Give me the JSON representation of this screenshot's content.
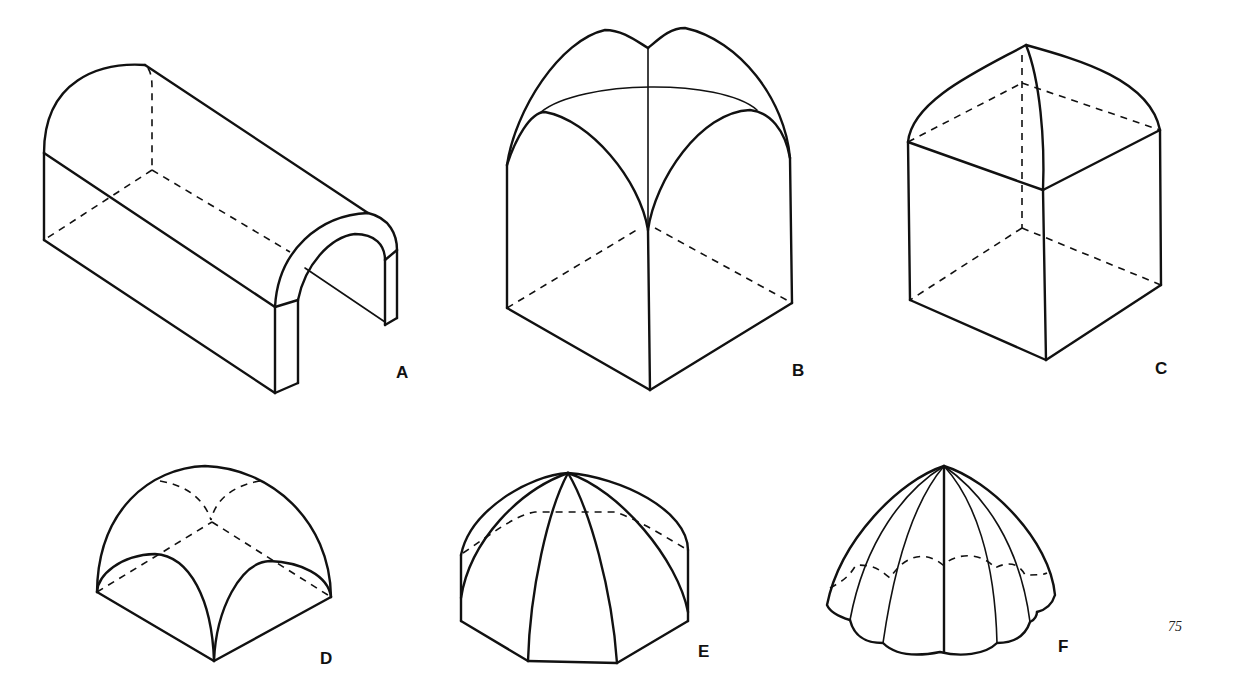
{
  "figure": {
    "panels": [
      {
        "id": "A",
        "label": "A",
        "subject": "barrel-vault"
      },
      {
        "id": "B",
        "label": "B",
        "subject": "groin-vault-pointed"
      },
      {
        "id": "C",
        "label": "C",
        "subject": "cloister-vault-on-cube"
      },
      {
        "id": "D",
        "label": "D",
        "subject": "domical-groin-vault"
      },
      {
        "id": "E",
        "label": "E",
        "subject": "octagonal-ribbed-dome"
      },
      {
        "id": "F",
        "label": "F",
        "subject": "fluted-scalloped-dome"
      }
    ],
    "page_number": "75",
    "colors": {
      "ink": "#111111",
      "background": "#ffffff"
    }
  }
}
